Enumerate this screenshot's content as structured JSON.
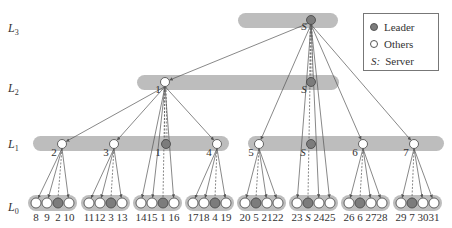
{
  "diagram": {
    "colors": {
      "bar": "#bdbdbd",
      "leader_fill": "#7c7c7c",
      "other_fill": "#ffffff",
      "stroke": "#444444",
      "edge": "#555555"
    },
    "levels": [
      {
        "label": "L",
        "sub": "3"
      },
      {
        "label": "L",
        "sub": "2"
      },
      {
        "label": "L",
        "sub": "1"
      },
      {
        "label": "L",
        "sub": "0"
      }
    ],
    "legend": {
      "leader": "Leader",
      "others": "Others",
      "server_key": "S:",
      "server": "Server"
    },
    "l3": {
      "node_label": "S",
      "role": "leader"
    },
    "l2": [
      {
        "node_label": "1",
        "role": "other"
      },
      {
        "node_label": "S",
        "role": "leader"
      }
    ],
    "l1": [
      {
        "node_label": "2",
        "role": "other"
      },
      {
        "node_label": "3",
        "role": "other"
      },
      {
        "node_label": "1",
        "role": "leader"
      },
      {
        "node_label": "4",
        "role": "other"
      },
      {
        "node_label": "5",
        "role": "other"
      },
      {
        "node_label": "S",
        "role": "leader"
      },
      {
        "node_label": "6",
        "role": "other"
      },
      {
        "node_label": "7",
        "role": "other"
      }
    ],
    "l0_groups": [
      {
        "labels": [
          "8",
          "9",
          "2",
          "10"
        ],
        "leader_index": 2
      },
      {
        "labels": [
          "11",
          "12",
          "3",
          "13"
        ],
        "leader_index": 2
      },
      {
        "labels": [
          "14",
          "15",
          "1",
          "16"
        ],
        "leader_index": 2
      },
      {
        "labels": [
          "17",
          "18",
          "4",
          "19"
        ],
        "leader_index": 2
      },
      {
        "labels": [
          "20",
          "5",
          "21",
          "22"
        ],
        "leader_index": 1
      },
      {
        "labels": [
          "23",
          "S",
          "24",
          "25"
        ],
        "leader_index": 1
      },
      {
        "labels": [
          "26",
          "6",
          "27",
          "28"
        ],
        "leader_index": 1
      },
      {
        "labels": [
          "29",
          "7",
          "30",
          "31"
        ],
        "leader_index": 1
      }
    ]
  }
}
